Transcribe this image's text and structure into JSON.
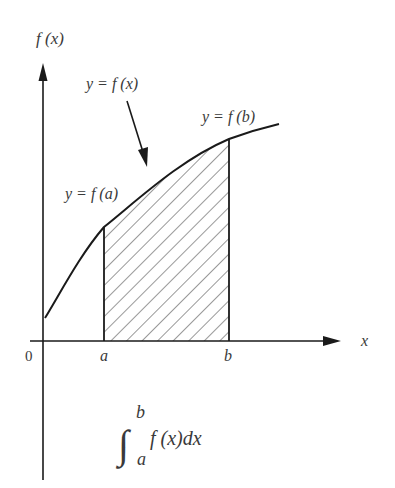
{
  "diagram": {
    "type": "definite-integral-area",
    "y_axis_label": "f (x)",
    "x_axis_label": "x",
    "origin_label": "0",
    "curve_label": "y = f (x)",
    "point_a_label": "y = f (a)",
    "point_b_label": "y = f (b)",
    "tick_a": "a",
    "tick_b": "b",
    "integral": {
      "upper": "b",
      "lower": "a",
      "integrand": "f (x)dx"
    },
    "colors": {
      "line": "#1a1a1a",
      "text": "#3a3a3a",
      "background": "#ffffff"
    }
  }
}
